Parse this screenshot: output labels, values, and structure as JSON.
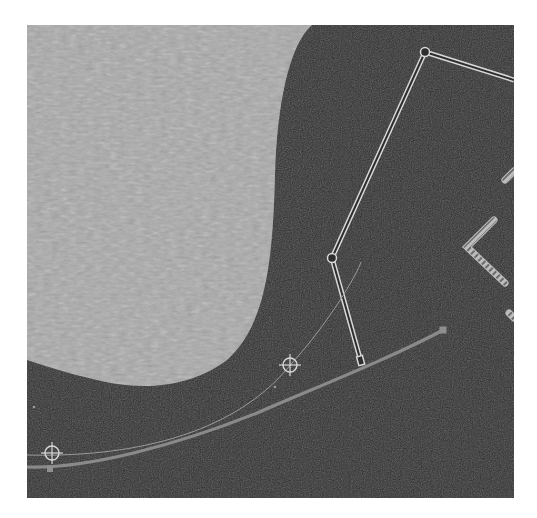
{
  "canvas": {
    "frame": {
      "x": 27,
      "y": 25,
      "width": 487,
      "height": 473
    },
    "colors": {
      "page_background": "#ffffff",
      "canvas_background": "#2e2e2e",
      "textured_shape_fill": "#a9a9a9",
      "outline_stroke": "#d8d8d8",
      "path_stroke": "#8a8a8a",
      "thin_path_stroke": "#9a9a9a",
      "guide_line": "#4a4a4a",
      "anchor_fill": "#8f8f8f",
      "hatch_fill": "#bdbdbd"
    },
    "textured_shape": {
      "description": "light gray textured blob occupying upper-left",
      "path": "M0,0 L285,0 C262,20 250,80 248,150 C246,230 240,300 200,335 C160,365 110,365 70,355 C40,348 15,340 0,335 Z"
    },
    "vertical_guides": [
      {
        "x1": 463,
        "y1": 0,
        "x2": 476,
        "y2": 473
      },
      {
        "x1": 316,
        "y1": 0,
        "x2": 318,
        "y2": 473
      }
    ],
    "polyline_outline": {
      "points": [
        [
          334,
          337
        ],
        [
          305,
          233
        ],
        [
          398,
          27
        ],
        [
          487,
          55
        ]
      ],
      "joints": [
        [
          305,
          233
        ],
        [
          398,
          27
        ]
      ],
      "end_cap": [
        334,
        337
      ]
    },
    "hatched_chevron": {
      "points": [
        [
          467,
          195
        ],
        [
          440,
          222
        ],
        [
          478,
          258
        ]
      ]
    },
    "hatched_fragments": [
      {
        "x1": 478,
        "y1": 155,
        "x2": 487,
        "y2": 146
      },
      {
        "x1": 482,
        "y1": 288,
        "x2": 487,
        "y2": 293
      }
    ],
    "thin_curve": {
      "path": "M0,430 C80,432 200,420 265,338 C300,300 330,250 334,237"
    },
    "thick_curve": {
      "path": "M0,442 C60,444 150,420 230,388 C300,358 370,330 416,305"
    },
    "anchors": [
      {
        "x": 416,
        "y": 305,
        "size": 7
      },
      {
        "x": 23,
        "y": 444,
        "size": 6
      }
    ],
    "crosshair_handles": [
      {
        "x": 263,
        "y": 340,
        "r": 7
      },
      {
        "x": 25,
        "y": 428,
        "r": 7
      }
    ],
    "small_dots": [
      {
        "x": 248,
        "y": 362
      },
      {
        "x": 7,
        "y": 382
      }
    ]
  }
}
